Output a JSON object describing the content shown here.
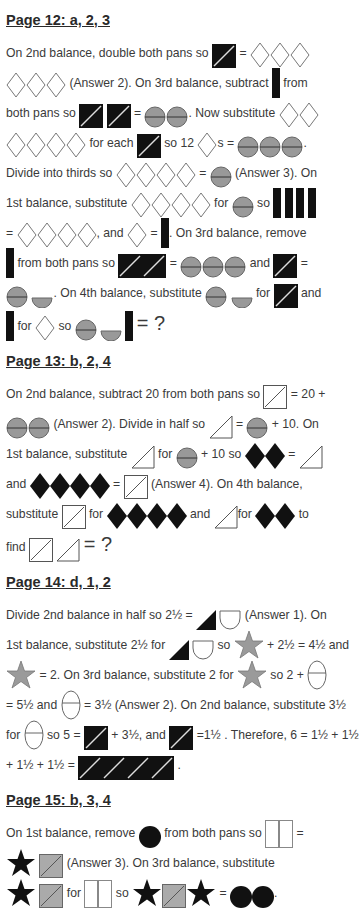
{
  "sections": [
    {
      "title": "Page 12:  a, 2, 3",
      "text": {
        "t1": "On 2nd balance, double both pans so",
        "eq": "=",
        "t2": "(Answer 2).  On 3rd balance, subtract",
        "t3": "from",
        "t4": "both pans so",
        "t5": ".  Now substitute",
        "t6": "for each",
        "t7": "so 12",
        "t8": "s =",
        "t9": ".",
        "t10": "Divide into thirds so",
        "t11": "(Answer 3).  On",
        "t12": "1st balance, substitute",
        "t13": "for",
        "t14": "so",
        "t15": ", and",
        "t16": ".  On 3rd balance, remove",
        "t17": "from both pans so",
        "t18": "and",
        "t19": ".  On 4th balance, substitute",
        "t20": "for",
        "t21": "and",
        "t22": "for",
        "t23": "so",
        "t24": "= ?"
      }
    },
    {
      "title": "Page 13:  b, 2, 4",
      "text": {
        "t1": "On 2nd balance, subtract 20 from both pans so",
        "t2": "= 20 +",
        "t3": "(Answer 2).  Divide in half so",
        "t4": "+ 10.  On",
        "t5": "1st balance, substitute",
        "t6": "for",
        "t7": "+ 10 so",
        "t8": "and",
        "t9": "(Answer 4).  On 4th balance,",
        "t10": "substitute",
        "t11": "for",
        "t12": "and",
        "t13": "to",
        "t14": "find",
        "t15": "= ?"
      }
    },
    {
      "title": "Page 14:  d, 1, 2",
      "text": {
        "t1": "Divide 2nd balance in half so 2½ =",
        "t2": "(Answer 1).   On",
        "t3": "1st balance, substitute 2½ for",
        "t4": "so",
        "t5": "+ 2½ = 4½ and",
        "t6": "= 2.  On 3rd balance, substitute 2 for",
        "t7": "so 2 +",
        "t8": "= 5½ and",
        "t9": "= 3½ (Answer 2).  On 2nd balance, substitute 3½",
        "t10": "for",
        "t11": "so 5 =",
        "t12": "+ 3½, and",
        "t13": "=1½ . Therefore, 6 = 1½ + 1½",
        "t14": "+ 1½ + 1½ =",
        "t15": "."
      }
    },
    {
      "title": "Page 15:  b, 3, 4",
      "text": {
        "t1": "On 1st balance, remove",
        "t2": "from both pans so",
        "t3": "=",
        "t4": "(Answer 3).  On 3rd balance, substitute",
        "t5": "for",
        "t6": "so",
        "t7": "=",
        "t8": "."
      }
    }
  ],
  "shape_icons": [
    "black-square-slash",
    "white-diamond",
    "black-bar",
    "gray-circle-split",
    "gray-half-circle",
    "white-square-slash",
    "white-triangle",
    "black-diamond",
    "black-triangle",
    "white-cup",
    "gray-star",
    "white-oval-split",
    "black-circle",
    "black-star",
    "gray-square-slash",
    "white-tall-rect"
  ]
}
